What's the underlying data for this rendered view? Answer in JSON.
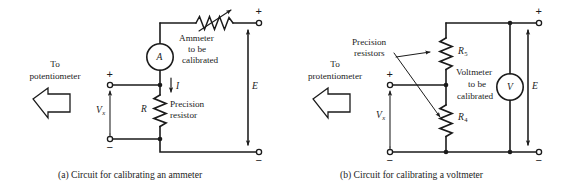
{
  "figure": {
    "title_hidden": "Calibration circuits",
    "stroke_color": "#1b1b1b",
    "background": "#ffffff"
  },
  "panel_a": {
    "caption": "(a) Circuit for calibrating an ammeter",
    "source_label_line1": "To",
    "source_label_line2": "potentiometer",
    "meter_symbol": "A",
    "meter_note_line1": "Ammeter",
    "meter_note_line2": "to be",
    "meter_note_line3": "calibrated",
    "current_label": "I",
    "resistor_symbol": "R",
    "resistor_note_line1": "Precision",
    "resistor_note_line2": "resistor",
    "voltage_label": "V",
    "voltage_sub": "x",
    "supply_label": "E",
    "plus_left": "+",
    "minus_left": "−",
    "plus_right": "+",
    "minus_right": "−"
  },
  "panel_b": {
    "caption": "(b) Circuit for calibrating a voltmeter",
    "source_label_line1": "To",
    "source_label_line2": "protentiometer",
    "precision_note_line1": "Precision",
    "precision_note_line2": "resistors",
    "resistor_top_symbol": "R",
    "resistor_top_sub": "5",
    "resistor_bottom_symbol": "R",
    "resistor_bottom_sub": "4",
    "meter_symbol": "V",
    "meter_note_line1": "Voltmeter",
    "meter_note_line2": "to be",
    "meter_note_line3": "calibrated",
    "voltage_label": "V",
    "voltage_sub": "x",
    "supply_label": "E",
    "plus_left": "+",
    "minus_left": "−",
    "plus_right": "+",
    "minus_right": "−"
  }
}
